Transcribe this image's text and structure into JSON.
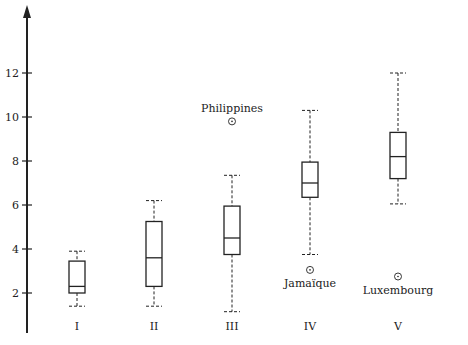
{
  "chart_data": {
    "type": "box",
    "title": "",
    "xlabel": "",
    "ylabel": "",
    "ylim": [
      0,
      15
    ],
    "yticks": [
      2,
      4,
      6,
      8,
      10,
      12
    ],
    "grid": false,
    "legend": null,
    "categories": [
      "I",
      "II",
      "III",
      "IV",
      "V"
    ],
    "boxes": [
      {
        "category": "I",
        "whisker_low": 1.4,
        "q1": 2.0,
        "median": 2.3,
        "q3": 3.45,
        "whisker_high": 3.9,
        "outliers": []
      },
      {
        "category": "II",
        "whisker_low": 1.4,
        "q1": 2.3,
        "median": 3.6,
        "q3": 5.25,
        "whisker_high": 6.2,
        "outliers": []
      },
      {
        "category": "III",
        "whisker_low": 1.15,
        "q1": 3.75,
        "median": 4.5,
        "q3": 5.95,
        "whisker_high": 7.35,
        "outliers": [
          {
            "label": "Philippines",
            "value": 9.8
          }
        ]
      },
      {
        "category": "IV",
        "whisker_low": 3.75,
        "q1": 6.35,
        "median": 7.0,
        "q3": 7.95,
        "whisker_high": 10.3,
        "outliers": [
          {
            "label": "Jamaïque",
            "value": 3.05
          }
        ]
      },
      {
        "category": "V",
        "whisker_low": 6.05,
        "q1": 7.2,
        "median": 8.2,
        "q3": 9.3,
        "whisker_high": 12.0,
        "outliers": [
          {
            "label": "Luxembourg",
            "value": 2.75
          }
        ]
      }
    ],
    "colors": {
      "stroke": "#222222",
      "background": "#ffffff"
    }
  }
}
